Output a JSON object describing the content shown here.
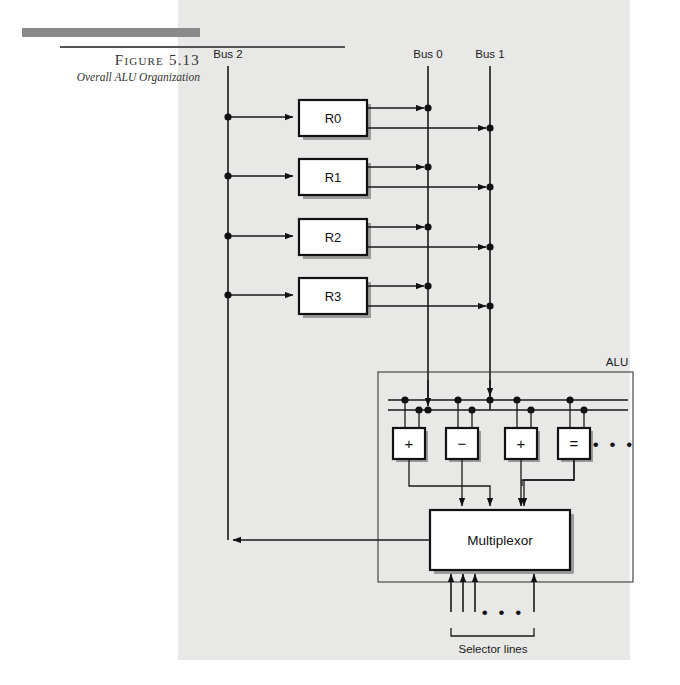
{
  "figure": {
    "number_label": "Figure 5.13",
    "caption": "Overall ALU Organization"
  },
  "buses": [
    {
      "name": "bus-2",
      "label": "Bus 2",
      "x": 228
    },
    {
      "name": "bus-0",
      "label": "Bus 0",
      "x": 428
    },
    {
      "name": "bus-1",
      "label": "Bus 1",
      "x": 490
    }
  ],
  "registers": [
    {
      "name": "register-r0",
      "label": "R0",
      "y": 117
    },
    {
      "name": "register-r1",
      "label": "R1",
      "y": 176
    },
    {
      "name": "register-r2",
      "label": "R2",
      "y": 236
    },
    {
      "name": "register-r3",
      "label": "R3",
      "y": 295
    }
  ],
  "alu": {
    "label": "ALU",
    "units": [
      {
        "name": "alu-unit-add",
        "symbol": "+",
        "x": 413
      },
      {
        "name": "alu-unit-subtract",
        "symbol": "−",
        "x": 466
      },
      {
        "name": "alu-unit-multiply",
        "symbol": "+",
        "x": 525
      },
      {
        "name": "alu-unit-compare",
        "symbol": "=",
        "x": 578
      }
    ],
    "ellipsis": "• • •",
    "multiplexor": {
      "label": "Multiplexor"
    }
  },
  "selector": {
    "label": "Selector lines",
    "ellipsis": "• • •"
  }
}
